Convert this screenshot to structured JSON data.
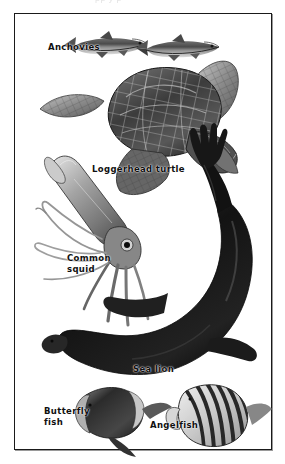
{
  "plate": {
    "type": "scientific-illustration-plate",
    "medium": "grayscale halftone drawing",
    "background_color": "#ffffff",
    "frame_color": "#1a1a1a",
    "label_color": "#101010",
    "top_cropped_text": "pp y p"
  },
  "labels": {
    "anchovies": "Anchovies",
    "loggerhead_turtle": "Loggerhead turtle",
    "common_squid": "Common\nsquid",
    "sea_lion": "Sea lion",
    "butterfly_fish": "Butterfly\nfish",
    "angelfish": "Angelfish"
  },
  "figures": [
    {
      "name": "anchovy-left",
      "label": "Anchovies",
      "position": "top-left"
    },
    {
      "name": "anchovy-right",
      "label": "Anchovies",
      "position": "top-right"
    },
    {
      "name": "loggerhead-turtle",
      "label": "Loggerhead turtle",
      "position": "upper-middle"
    },
    {
      "name": "common-squid",
      "label": "Common squid",
      "position": "middle-left"
    },
    {
      "name": "sea-lion",
      "label": "Sea lion",
      "position": "middle-right"
    },
    {
      "name": "butterfly-fish",
      "label": "Butterfly fish",
      "position": "bottom-left"
    },
    {
      "name": "angelfish",
      "label": "Angelfish",
      "position": "bottom-right"
    }
  ]
}
